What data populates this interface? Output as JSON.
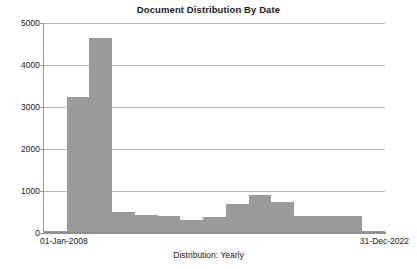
{
  "chart_data": {
    "type": "bar",
    "title": "Document Distribution By Date",
    "xlabel": "Distribution: Yearly",
    "ylabel": "",
    "categories": [
      "2008",
      "2009",
      "2010",
      "2011",
      "2012",
      "2013",
      "2014",
      "2015",
      "2016",
      "2017",
      "2018",
      "2019",
      "2020",
      "2021",
      "2022"
    ],
    "values": [
      50,
      3250,
      4650,
      490,
      440,
      400,
      320,
      370,
      690,
      900,
      730,
      400,
      400,
      400,
      55
    ],
    "ylim": [
      0,
      5000
    ],
    "y_ticks": [
      0,
      1000,
      2000,
      3000,
      4000,
      5000
    ],
    "y_tick_labels": [
      "0",
      "1000",
      "2000",
      "3000",
      "4000",
      "5000"
    ],
    "x_range_start_label": "01-Jan-2008",
    "x_range_end_label": "31-Dec-2022",
    "grid": true,
    "legend": "none",
    "bar_color": "#9a9b9b",
    "grid_color": "#b9bbbb",
    "axis_color": "#8f9191",
    "text_color": "#1a1a1a",
    "background_color": "#ffffff"
  }
}
